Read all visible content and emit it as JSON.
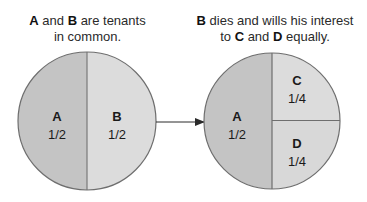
{
  "left_caption": {
    "subject1": "A",
    "text1": " and ",
    "subject2": "B",
    "text2": " are tenants",
    "line2": "in common."
  },
  "right_caption": {
    "subject1": "B",
    "text1": " dies and wills his interest",
    "line2_pre": "to ",
    "subject2": "C",
    "line2_mid": " and ",
    "subject3": "D",
    "line2_post": " equally."
  },
  "left_circle": {
    "segments": [
      {
        "name": "A",
        "share": "1/2",
        "color": "#c4c4c4"
      },
      {
        "name": "B",
        "share": "1/2",
        "color": "#dcdcdc"
      }
    ]
  },
  "right_circle": {
    "segments": [
      {
        "name": "A",
        "share": "1/2",
        "color": "#c4c4c4"
      },
      {
        "name": "C",
        "share": "1/4",
        "color": "#dcdcdc"
      },
      {
        "name": "D",
        "share": "1/4",
        "color": "#dcdcdc"
      }
    ]
  },
  "colors": {
    "outline": "#6e6e6e",
    "arrow": "#2a2a2a"
  }
}
